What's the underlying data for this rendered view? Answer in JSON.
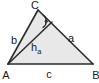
{
  "diagram": {
    "type": "geometry-triangle-altitude",
    "background_color": "#ffffff",
    "fill_color": "#e8e8e8",
    "stroke_color": "#333333",
    "label_color": "#1a1a1a",
    "vertices": [
      {
        "name": "A",
        "label": "A",
        "x": 8,
        "y": 64,
        "label_x": 6,
        "label_y": 78
      },
      {
        "name": "B",
        "label": "B",
        "x": 93,
        "y": 64,
        "label_x": 96,
        "label_y": 78
      },
      {
        "name": "C",
        "label": "C",
        "x": 38,
        "y": 10,
        "label_x": 35,
        "label_y": 9
      }
    ],
    "sides": [
      {
        "name": "side-a",
        "label": "a",
        "from": "C",
        "to": "B",
        "label_x": 71,
        "label_y": 41
      },
      {
        "name": "side-b",
        "label": "b",
        "from": "A",
        "to": "C",
        "label_x": 14,
        "label_y": 43
      },
      {
        "name": "side-c",
        "label": "c",
        "from": "A",
        "to": "B",
        "label_x": 49,
        "label_y": 77
      }
    ],
    "altitude": {
      "name": "altitude-ha",
      "label_main": "h",
      "label_sub": "a",
      "from": "A",
      "foot_x": 52,
      "foot_y": 22,
      "label_x": 32,
      "label_y": 51
    },
    "right_angle_marker": {
      "name": "right-angle-marker",
      "center_x": 48,
      "center_y": 22,
      "dot_x": 46,
      "dot_y": 21,
      "radius": 7
    }
  }
}
